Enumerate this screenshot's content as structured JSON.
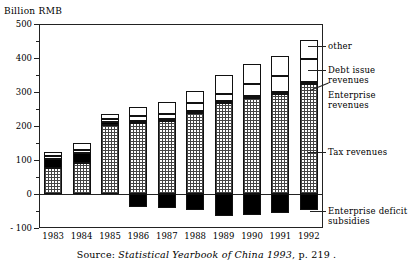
{
  "axis": {
    "y_title": "Billion RMB",
    "y_ticks": [
      "500",
      "400",
      "300",
      "200",
      "100",
      "0",
      "- 100"
    ],
    "y_values": [
      500,
      400,
      300,
      200,
      100,
      0,
      -100
    ]
  },
  "source": {
    "prefix": "Source: ",
    "italic": "Statistical Yearbook of China 1993",
    "suffix": ", p. 219 ."
  },
  "annotations": {
    "other": "other",
    "debt": "Debt issue revenues",
    "enterprise": "Enterprise\nrevenues",
    "tax": "Tax revenues",
    "deficit": "Enterprise deficit\nsubsidies"
  },
  "chart_data": {
    "type": "bar",
    "title": "",
    "xlabel": "",
    "ylabel": "Billion RMB",
    "ylim": [
      -100,
      500
    ],
    "grid": false,
    "stacked": true,
    "legend_position": "right-annotations",
    "categories": [
      "1983",
      "1984",
      "1985",
      "1986",
      "1987",
      "1988",
      "1989",
      "1990",
      "1991",
      "1992"
    ],
    "series": [
      {
        "name": "Tax revenues",
        "pattern": "crosshatch",
        "values": [
          77,
          92,
          204,
          209,
          214,
          239,
          268,
          282,
          295,
          325
        ]
      },
      {
        "name": "Enterprise revenues",
        "pattern": "solid-black",
        "values": [
          27,
          29,
          8,
          6,
          6,
          6,
          6,
          6,
          4,
          4
        ]
      },
      {
        "name": "Debt issue revenues",
        "pattern": "dotted",
        "values": [
          8,
          7,
          9,
          14,
          14,
          24,
          19,
          35,
          49,
          67
        ]
      },
      {
        "name": "other",
        "pattern": "white",
        "values": [
          13,
          21,
          14,
          27,
          37,
          35,
          58,
          60,
          58,
          58
        ]
      },
      {
        "name": "Enterprise deficit subsidies",
        "pattern": "solid-black",
        "values": [
          0,
          0,
          0,
          -37,
          -41,
          -47,
          -64,
          -62,
          -55,
          -48
        ]
      }
    ]
  }
}
